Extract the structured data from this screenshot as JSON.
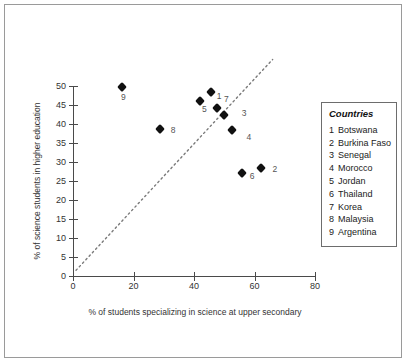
{
  "chart_data": {
    "type": "scatter",
    "title": "",
    "xlabel": "% of students specializing in science at upper secondary",
    "ylabel": "% of science students in higher education",
    "xlim": [
      0,
      80
    ],
    "ylim": [
      0,
      50
    ],
    "xticks": [
      "0",
      "20",
      "40",
      "60",
      "80"
    ],
    "yticks": [
      "0",
      "5",
      "10",
      "15",
      "20",
      "25",
      "30",
      "35",
      "40",
      "45",
      "50"
    ],
    "grid": false,
    "legend_position": "right",
    "points": [
      {
        "key": "1",
        "name": "Botswana",
        "x": 45.5,
        "y": 48.5,
        "label_dx": 6,
        "label_dy": 4
      },
      {
        "key": "2",
        "name": "Burkina Faso",
        "x": 62.0,
        "y": 28.4,
        "label_dx": 12,
        "label_dy": 1
      },
      {
        "key": "3",
        "name": "Senegal",
        "x": 49.8,
        "y": 42.4,
        "label_dx": 18,
        "label_dy": -2
      },
      {
        "key": "4",
        "name": "Morocco",
        "x": 52.4,
        "y": 38.4,
        "label_dx": 15,
        "label_dy": 7
      },
      {
        "key": "5",
        "name": "Jordan",
        "x": 42.0,
        "y": 46.0,
        "label_dx": 2,
        "label_dy": 8
      },
      {
        "key": "6",
        "name": "Thailand",
        "x": 55.8,
        "y": 27.1,
        "label_dx": 8,
        "label_dy": 3
      },
      {
        "key": "7",
        "name": "Korea",
        "x": 47.6,
        "y": 44.3,
        "label_dx": 7,
        "label_dy": -9
      },
      {
        "key": "8",
        "name": "Malaysia",
        "x": 28.7,
        "y": 38.7,
        "label_dx": 11,
        "label_dy": 1
      },
      {
        "key": "9",
        "name": "Argentina",
        "x": 16.2,
        "y": 49.8,
        "label_dx": -1,
        "label_dy": 10
      }
    ],
    "trend_line": {
      "style": "dotted",
      "x_start": 1.0,
      "y_start": 1.5,
      "x_end": 66.0,
      "y_end": 57.0
    }
  },
  "legend": {
    "title": "Countries",
    "items": [
      {
        "key": "1",
        "name": "Botswana"
      },
      {
        "key": "2",
        "name": "Burkina Faso"
      },
      {
        "key": "3",
        "name": "Senegal"
      },
      {
        "key": "4",
        "name": "Morocco"
      },
      {
        "key": "5",
        "name": "Jordan"
      },
      {
        "key": "6",
        "name": "Thailand"
      },
      {
        "key": "7",
        "name": "Korea"
      },
      {
        "key": "8",
        "name": "Malaysia"
      },
      {
        "key": "9",
        "name": "Argentina"
      }
    ]
  },
  "colors": {
    "marker": "#111111",
    "axis": "#4a4a4a",
    "frame": "#9a9a9a",
    "legend_border": "#6d6d6d",
    "text": "#333333"
  }
}
